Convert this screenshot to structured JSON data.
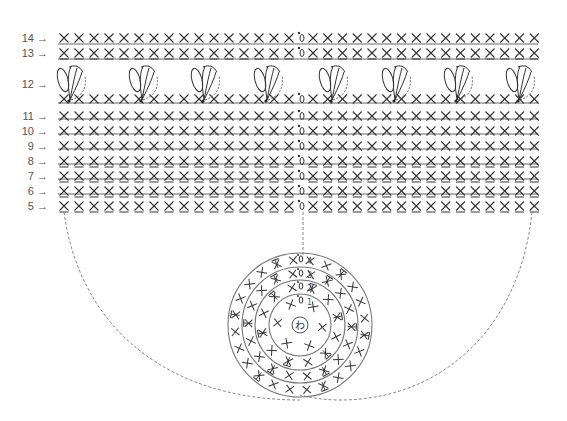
{
  "diagram": {
    "type": "crochet-chart",
    "colors": {
      "ink": "#333333",
      "line": "#666666",
      "dash": "#888888",
      "label": "#555555",
      "background": "#ffffff"
    },
    "rows": [
      {
        "label": "14 →",
        "y": 38,
        "symbol": "sc",
        "line_below": 44
      },
      {
        "label": "13 →",
        "y": 53,
        "symbol": "sc-back-loop",
        "line_below": 59
      },
      {
        "label": "12 →",
        "y": 84,
        "symbol": "cluster",
        "line_below": null
      },
      {
        "label": "",
        "y": 99,
        "symbol": "sc",
        "line_below": 103
      },
      {
        "label": "11 →",
        "y": 116,
        "symbol": "sc",
        "line_below": 119
      },
      {
        "label": "10 →",
        "y": 131,
        "symbol": "sc",
        "line_below": 134
      },
      {
        "label": "9 →",
        "y": 146,
        "symbol": "sc",
        "line_below": 149
      },
      {
        "label": "8 →",
        "y": 161,
        "symbol": "sc-back-loop",
        "line_below": 164
      },
      {
        "label": "7 →",
        "y": 176,
        "symbol": "sc-back-loop",
        "line_below": 179
      },
      {
        "label": "6 →",
        "y": 191,
        "symbol": "sc-back-loop",
        "line_below": 194
      },
      {
        "label": "5 →",
        "y": 206,
        "symbol": "sc-back-loop",
        "line_below": null
      }
    ],
    "stitches_per_side": 16,
    "chain_marker": "ch-0",
    "cluster_positions": [
      68,
      140,
      202,
      265,
      330,
      393,
      455,
      517
    ],
    "round_chart": {
      "center_label": "わ",
      "round_markers": [
        "1",
        "2",
        "3",
        "4"
      ],
      "rings": [
        {
          "round": 1,
          "r": 22,
          "symbols": [
            "X",
            "X",
            "X",
            "X",
            "X",
            "X"
          ]
        },
        {
          "round": 2,
          "r": 45,
          "symbols": [
            "V",
            "X",
            "V",
            "X",
            "V",
            "X",
            "V",
            "X",
            "V",
            "X",
            "V",
            "X"
          ]
        },
        {
          "round": 3,
          "r": 58,
          "symbols": [
            "X",
            "V",
            "X",
            "X",
            "V",
            "X",
            "X",
            "V",
            "X",
            "X",
            "V",
            "X",
            "X",
            "V",
            "X",
            "X",
            "V",
            "X"
          ]
        },
        {
          "round": 4,
          "r": 70,
          "symbols": [
            "X",
            "X",
            "V",
            "X",
            "X",
            "X",
            "V",
            "X",
            "X",
            "X",
            "V",
            "X",
            "X",
            "X",
            "V",
            "X",
            "X",
            "X",
            "V",
            "X",
            "X",
            "X",
            "V",
            "X"
          ]
        }
      ]
    }
  }
}
